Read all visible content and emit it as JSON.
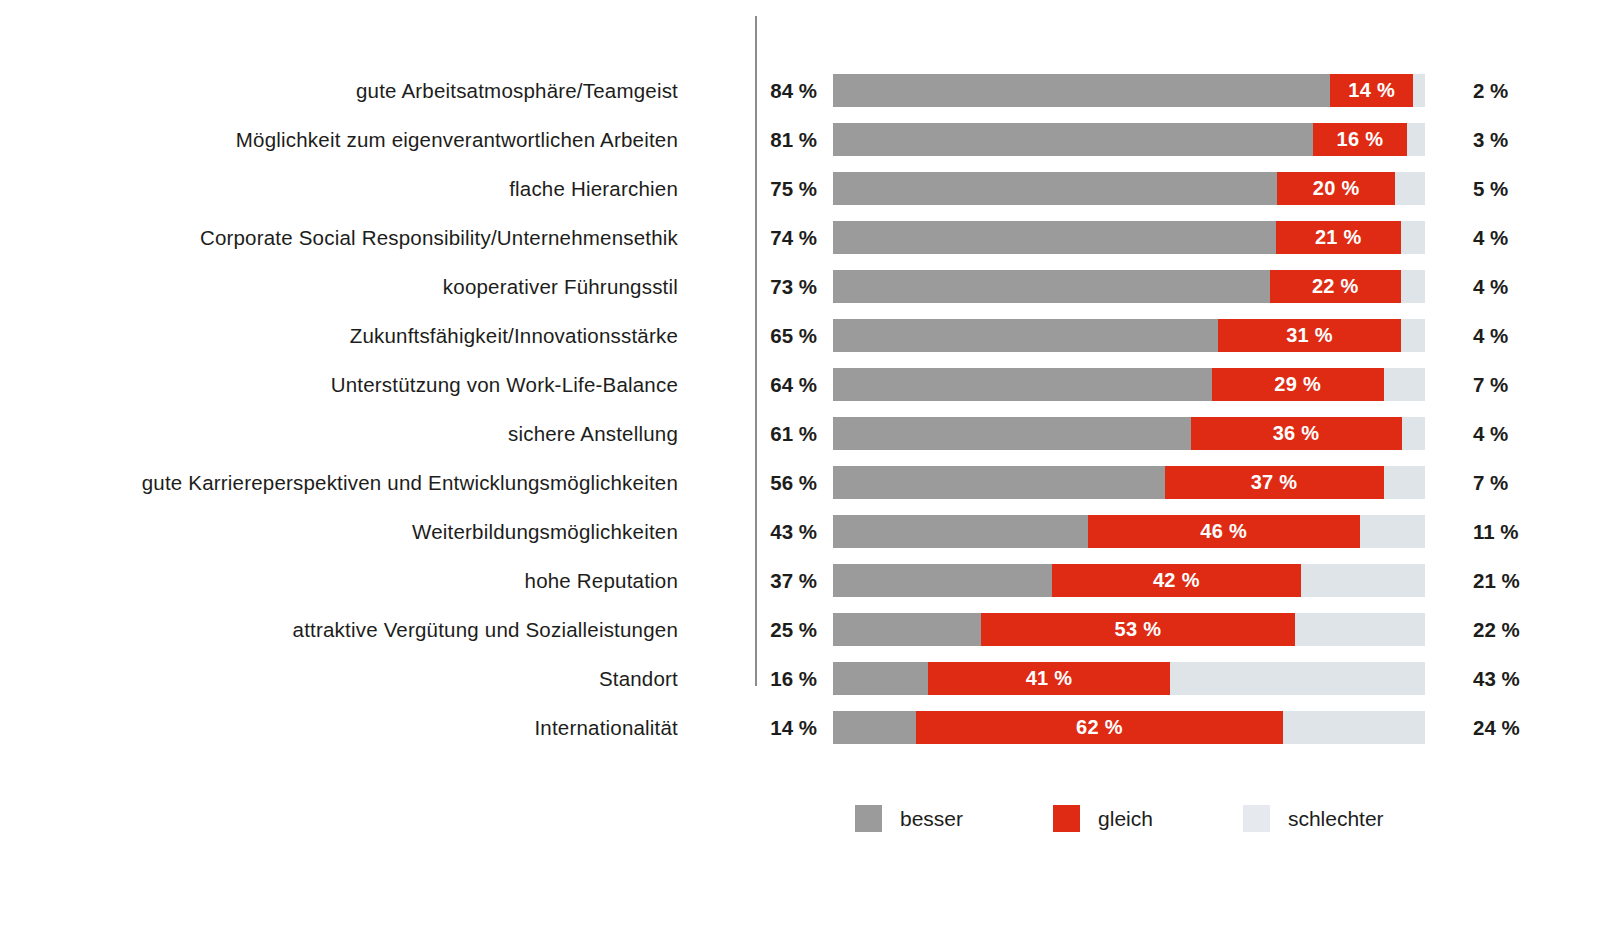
{
  "chart_data": {
    "type": "bar",
    "subtype": "stacked-horizontal-100",
    "title": "",
    "subtitle": "",
    "xlabel": "",
    "ylabel": "",
    "grid": false,
    "xlim": [
      0,
      100
    ],
    "legend_position": "bottom",
    "unit": "%",
    "categories": [
      "gute Arbeitsatmosphäre/Teamgeist",
      "Möglichkeit zum eigenverantwortlichen Arbeiten",
      "flache Hierarchien",
      "Corporate Social Responsibility/Unternehmensethik",
      "kooperativer Führungsstil",
      "Zukunftsfähigkeit/Innovationsstärke",
      "Unterstützung von Work-Life-Balance",
      "sichere Anstellung",
      "gute Karriereperspektiven und Entwicklungsmöglichkeiten",
      "Weiterbildungsmöglichkeiten",
      "hohe Reputation",
      "attraktive Vergütung und Sozialleistungen",
      "Standort",
      "Internationalität"
    ],
    "series": [
      {
        "name": "besser",
        "color": "#9b9b9b",
        "values": [
          84,
          81,
          75,
          74,
          73,
          65,
          64,
          61,
          56,
          43,
          37,
          25,
          16,
          14
        ]
      },
      {
        "name": "gleich",
        "color": "#e02b14",
        "values": [
          14,
          16,
          20,
          21,
          22,
          31,
          29,
          36,
          37,
          46,
          42,
          53,
          41,
          62
        ]
      },
      {
        "name": "schlechter",
        "color": "#dfe4e8",
        "values": [
          2,
          3,
          5,
          4,
          4,
          4,
          7,
          4,
          7,
          11,
          21,
          22,
          43,
          24
        ]
      }
    ]
  },
  "rows": [
    {
      "label": "gute Arbeitsatmosphäre/Teamgeist",
      "left_value": "84 %",
      "besser": 84,
      "mid_value": "14 %",
      "gleich": 14,
      "right_value": "2 %",
      "schlechter": 2
    },
    {
      "label": "Möglichkeit zum eigenverantwortlichen Arbeiten",
      "left_value": "81 %",
      "besser": 81,
      "mid_value": "16 %",
      "gleich": 16,
      "right_value": "3 %",
      "schlechter": 3
    },
    {
      "label": "flache Hierarchien",
      "left_value": "75 %",
      "besser": 75,
      "mid_value": "20 %",
      "gleich": 20,
      "right_value": "5 %",
      "schlechter": 5
    },
    {
      "label": "Corporate Social Responsibility/Unternehmensethik",
      "left_value": "74 %",
      "besser": 74,
      "mid_value": "21 %",
      "gleich": 21,
      "right_value": "4 %",
      "schlechter": 4
    },
    {
      "label": "kooperativer Führungsstil",
      "left_value": "73 %",
      "besser": 73,
      "mid_value": "22 %",
      "gleich": 22,
      "right_value": "4 %",
      "schlechter": 4
    },
    {
      "label": "Zukunftsfähigkeit/Innovationsstärke",
      "left_value": "65 %",
      "besser": 65,
      "mid_value": "31 %",
      "gleich": 31,
      "right_value": "4 %",
      "schlechter": 4
    },
    {
      "label": "Unterstützung von Work-Life-Balance",
      "left_value": "64 %",
      "besser": 64,
      "mid_value": "29 %",
      "gleich": 29,
      "right_value": "7 %",
      "schlechter": 7
    },
    {
      "label": "sichere Anstellung",
      "left_value": "61 %",
      "besser": 61,
      "mid_value": "36 %",
      "gleich": 36,
      "right_value": "4 %",
      "schlechter": 4
    },
    {
      "label": "gute Karriereperspektiven und Entwicklungsmöglichkeiten",
      "left_value": "56 %",
      "besser": 56,
      "mid_value": "37 %",
      "gleich": 37,
      "right_value": "7 %",
      "schlechter": 7
    },
    {
      "label": "Weiterbildungsmöglichkeiten",
      "left_value": "43 %",
      "besser": 43,
      "mid_value": "46 %",
      "gleich": 46,
      "right_value": "11 %",
      "schlechter": 11
    },
    {
      "label": "hohe Reputation",
      "left_value": "37 %",
      "besser": 37,
      "mid_value": "42 %",
      "gleich": 42,
      "right_value": "21 %",
      "schlechter": 21
    },
    {
      "label": "attraktive Vergütung und Sozialleistungen",
      "left_value": "25 %",
      "besser": 25,
      "mid_value": "53 %",
      "gleich": 53,
      "right_value": "22 %",
      "schlechter": 22
    },
    {
      "label": "Standort",
      "left_value": "16 %",
      "besser": 16,
      "mid_value": "41 %",
      "gleich": 41,
      "right_value": "43 %",
      "schlechter": 43
    },
    {
      "label": "Internationalität",
      "left_value": "14 %",
      "besser": 14,
      "mid_value": "62 %",
      "gleich": 62,
      "right_value": "24 %",
      "schlechter": 24
    }
  ],
  "legend": {
    "items": [
      {
        "label": "besser",
        "color": "#9b9b9b",
        "swatch_class": "sw-besser"
      },
      {
        "label": "gleich",
        "color": "#e02b14",
        "swatch_class": "sw-gleich"
      },
      {
        "label": "schlechter",
        "color": "#e6eaee",
        "swatch_class": "sw-schlechter"
      }
    ]
  },
  "colors": {
    "besser": "#9b9b9b",
    "gleich": "#e02b14",
    "schlechter": "#dfe4e8",
    "text": "#1d1d1b",
    "divider": "#8c8c8c",
    "background": "#ffffff"
  }
}
